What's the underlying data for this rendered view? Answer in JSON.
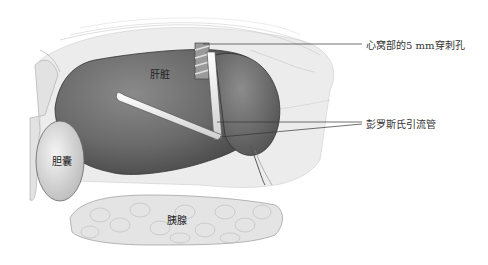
{
  "figure": {
    "organs": {
      "liver": "肝脏",
      "gallbladder": "胆囊",
      "pancreas": "胰腺"
    },
    "callouts": [
      {
        "text": "心窝部的5 mm穿刺孔"
      },
      {
        "text": "彭罗斯氏引流管"
      }
    ],
    "colors": {
      "liver": "#6e6e6e",
      "background_tissue": "#e8e8e8",
      "gallbladder": "#d9d9d9",
      "pancreas": "#dcdcdc",
      "drain": "#f2f2f2",
      "leader_line": "#333333"
    }
  }
}
